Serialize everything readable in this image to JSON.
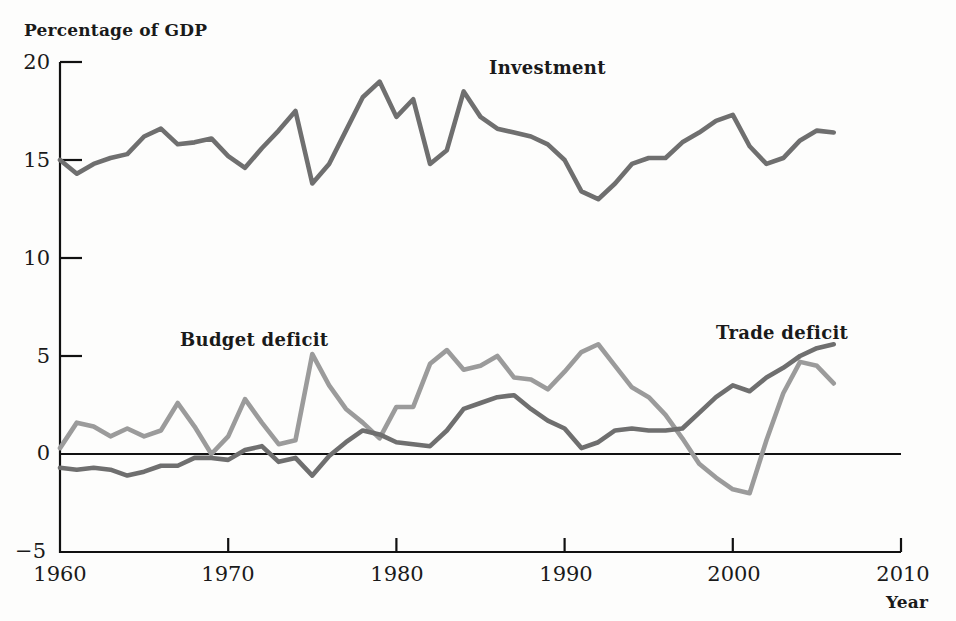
{
  "chart_data": {
    "type": "line",
    "title": "",
    "xlabel": "Year",
    "ylabel": "Percentage of GDP",
    "xlim": [
      1960,
      2010
    ],
    "ylim": [
      -5,
      20
    ],
    "grid": false,
    "legend_position": "inline-annotations",
    "x_ticks": [
      "1960",
      "1970",
      "1980",
      "1990",
      "2000",
      "2010"
    ],
    "y_ticks": [
      "20",
      "15",
      "10",
      "5",
      "0",
      "-5"
    ],
    "zero_line": 0,
    "annotations": [
      {
        "text": "Investment",
        "x": 1985,
        "y": 19.2
      },
      {
        "text": "Budget deficit",
        "x": 1968.5,
        "y": 6.0
      },
      {
        "text": "Trade deficit",
        "x": 1999.5,
        "y": 6.1
      }
    ],
    "series": [
      {
        "name": "Investment",
        "color": "#6f6f6f",
        "x": [
          1960,
          1961,
          1962,
          1963,
          1964,
          1965,
          1966,
          1967,
          1968,
          1969,
          1970,
          1971,
          1972,
          1973,
          1974,
          1975,
          1976,
          1977,
          1978,
          1979,
          1980,
          1981,
          1982,
          1983,
          1984,
          1985,
          1986,
          1987,
          1988,
          1989,
          1990,
          1991,
          1992,
          1993,
          1994,
          1995,
          1996,
          1997,
          1998,
          1999,
          2000,
          2001,
          2002,
          2003,
          2004,
          2005,
          2006
        ],
        "values": [
          15.0,
          14.3,
          14.8,
          15.1,
          15.3,
          16.2,
          16.6,
          15.8,
          15.9,
          16.1,
          15.2,
          14.6,
          15.6,
          16.5,
          17.5,
          13.8,
          14.8,
          16.5,
          18.2,
          19.0,
          17.2,
          18.1,
          14.8,
          15.5,
          18.5,
          17.2,
          16.6,
          16.4,
          16.2,
          15.8,
          15.0,
          13.4,
          13.0,
          13.8,
          14.8,
          15.1,
          15.1,
          15.9,
          16.4,
          17.0,
          17.3,
          15.7,
          14.8,
          15.1,
          16.0,
          16.5,
          16.4
        ]
      },
      {
        "name": "Budget deficit",
        "color": "#9b9b9b",
        "x": [
          1960,
          1961,
          1962,
          1963,
          1964,
          1965,
          1966,
          1967,
          1968,
          1969,
          1970,
          1971,
          1972,
          1973,
          1974,
          1975,
          1976,
          1977,
          1978,
          1979,
          1980,
          1981,
          1982,
          1983,
          1984,
          1985,
          1986,
          1987,
          1988,
          1989,
          1990,
          1991,
          1992,
          1993,
          1994,
          1995,
          1996,
          1997,
          1998,
          1999,
          2000,
          2001,
          2002,
          2003,
          2004,
          2005,
          2006
        ],
        "values": [
          0.3,
          1.6,
          1.4,
          0.9,
          1.3,
          0.9,
          1.2,
          2.6,
          1.4,
          0.0,
          0.9,
          2.8,
          1.6,
          0.5,
          0.7,
          5.1,
          3.5,
          2.3,
          1.6,
          0.8,
          2.4,
          2.4,
          4.6,
          5.3,
          4.3,
          4.5,
          5.0,
          3.9,
          3.8,
          3.3,
          4.2,
          5.2,
          5.6,
          4.5,
          3.4,
          2.9,
          2.0,
          0.8,
          -0.5,
          -1.2,
          -1.8,
          -2.0,
          0.7,
          3.1,
          4.7,
          4.5,
          3.6
        ]
      },
      {
        "name": "Trade deficit",
        "color": "#6f6f6f",
        "x": [
          1960,
          1961,
          1962,
          1963,
          1964,
          1965,
          1966,
          1967,
          1968,
          1969,
          1970,
          1971,
          1972,
          1973,
          1974,
          1975,
          1976,
          1977,
          1978,
          1979,
          1980,
          1981,
          1982,
          1983,
          1984,
          1985,
          1986,
          1987,
          1988,
          1989,
          1990,
          1991,
          1992,
          1993,
          1994,
          1995,
          1996,
          1997,
          1998,
          1999,
          2000,
          2001,
          2002,
          2003,
          2004,
          2005,
          2006
        ],
        "values": [
          -0.7,
          -0.8,
          -0.7,
          -0.8,
          -1.1,
          -0.9,
          -0.6,
          -0.6,
          -0.2,
          -0.2,
          -0.3,
          0.2,
          0.4,
          -0.4,
          -0.2,
          -1.1,
          -0.1,
          0.6,
          1.2,
          1.0,
          0.6,
          0.5,
          0.4,
          1.2,
          2.3,
          2.6,
          2.9,
          3.0,
          2.3,
          1.7,
          1.3,
          0.3,
          0.6,
          1.2,
          1.3,
          1.2,
          1.2,
          1.3,
          2.1,
          2.9,
          3.5,
          3.2,
          3.9,
          4.4,
          5.0,
          5.4,
          5.6
        ]
      }
    ]
  },
  "axes": {
    "y_title": "Percentage of GDP",
    "x_title": "Year"
  },
  "labels": {
    "investment": "Investment",
    "budget_deficit": "Budget deficit",
    "trade_deficit": "Trade deficit"
  },
  "ticks": {
    "y": [
      "20",
      "15",
      "10",
      "5",
      "0",
      "−5"
    ],
    "x": [
      "1960",
      "1970",
      "1980",
      "1990",
      "2000",
      "2010"
    ]
  },
  "colors": {
    "investment_line": "#6f6f6f",
    "budget_line": "#9b9b9b",
    "trade_line": "#6f6f6f",
    "axis": "#111111"
  }
}
